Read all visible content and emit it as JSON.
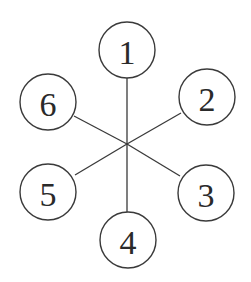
{
  "diagram": {
    "type": "star-graph",
    "hub": {
      "x": 127,
      "y": 144
    },
    "radius": 28,
    "nodes": [
      {
        "id": "1",
        "label": "1",
        "x": 127,
        "y": 50
      },
      {
        "id": "2",
        "label": "2",
        "x": 207,
        "y": 97
      },
      {
        "id": "3",
        "label": "3",
        "x": 206,
        "y": 193
      },
      {
        "id": "4",
        "label": "4",
        "x": 128,
        "y": 240
      },
      {
        "id": "5",
        "label": "5",
        "x": 48,
        "y": 192
      },
      {
        "id": "6",
        "label": "6",
        "x": 48,
        "y": 102
      }
    ],
    "edges": [
      {
        "from": "hub",
        "to": "1"
      },
      {
        "from": "hub",
        "to": "2"
      },
      {
        "from": "hub",
        "to": "3"
      },
      {
        "from": "hub",
        "to": "4"
      },
      {
        "from": "hub",
        "to": "5"
      },
      {
        "from": "hub",
        "to": "6"
      }
    ],
    "colors": {
      "stroke": "#3a3a3a",
      "text": "#2a2a2a",
      "background": "#ffffff"
    }
  }
}
